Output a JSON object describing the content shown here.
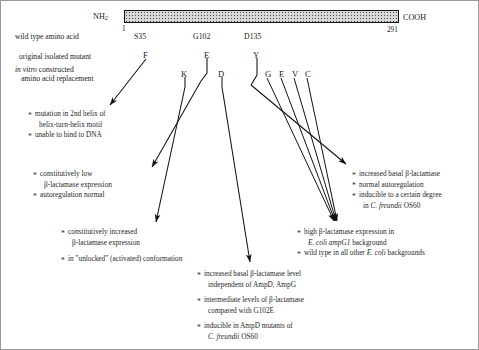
{
  "figure": {
    "protein": {
      "n_terminus": "NH",
      "n_terminus_sub": "2",
      "c_terminus": "COOH",
      "start_position": "1",
      "end_position": "291"
    },
    "row_labels": {
      "wild_type": "wild type amino acid",
      "original_mutant": "original isolated mutant",
      "constructed_line1": "in vitro constructed",
      "constructed_line1_italic": "in vitro",
      "constructed_line1_rest": " constructed",
      "constructed_line2": "amino acid replacement"
    },
    "sites": [
      {
        "wild_type": "S35",
        "original_mutant": "F",
        "replacements": []
      },
      {
        "wild_type": "G102",
        "original_mutant": "E",
        "replacements": [
          "K",
          "D"
        ]
      },
      {
        "wild_type": "D135",
        "original_mutant": "Y",
        "replacements": [
          "G",
          "E",
          "V",
          "C"
        ]
      }
    ],
    "phenotype_blocks": [
      {
        "id": "s35f",
        "lines": [
          {
            "bullet": true,
            "text": "mutation in 2nd helix of"
          },
          {
            "bullet": false,
            "text": "helix-turn-helix motif"
          },
          {
            "bullet": true,
            "text": "unable to bind to DNA"
          }
        ]
      },
      {
        "id": "g102e",
        "lines": [
          {
            "bullet": true,
            "text": "constitutively low"
          },
          {
            "bullet": false,
            "text": "β-lactamase expression"
          },
          {
            "bullet": true,
            "text": "autoregulation normal"
          }
        ]
      },
      {
        "id": "g102k",
        "lines": [
          {
            "bullet": true,
            "text": "constitutively increased"
          },
          {
            "bullet": false,
            "text": "β-lactamase expression"
          },
          {
            "bullet": true,
            "text": "in \"unlocked\" (activated) conformation"
          }
        ]
      },
      {
        "id": "d135y",
        "lines": [
          {
            "bullet": true,
            "text": "increased basal β-lactamase"
          },
          {
            "bullet": true,
            "text": "normal autoregulation"
          },
          {
            "bullet": true,
            "text": "inducible to a certain degree"
          },
          {
            "bullet": false,
            "text": "in C. freundii OS60",
            "italic_part": "C. freundii"
          }
        ]
      },
      {
        "id": "d135-gevc",
        "lines": [
          {
            "bullet": true,
            "text": "high β-lactamase expression in"
          },
          {
            "bullet": false,
            "text": "E. coli ampG1 background",
            "italic_part": "E. coli ampG1"
          },
          {
            "bullet": true,
            "text": "wild type in all other E. coli backgrounds",
            "italic_part": "E. coli"
          }
        ]
      },
      {
        "id": "g102d",
        "lines": [
          {
            "bullet": true,
            "text": "increased basal β-lactamase level"
          },
          {
            "bullet": false,
            "text": "independent of AmpD, AmpG"
          },
          {
            "bullet": true,
            "text": "intermediate levels of β-lactamase"
          },
          {
            "bullet": false,
            "text": "compared with G102E"
          },
          {
            "bullet": true,
            "text": "inducible in AmpD mutants of"
          },
          {
            "bullet": false,
            "text": "C. freundii OS60",
            "italic_part": "C. freundii"
          }
        ]
      }
    ]
  }
}
